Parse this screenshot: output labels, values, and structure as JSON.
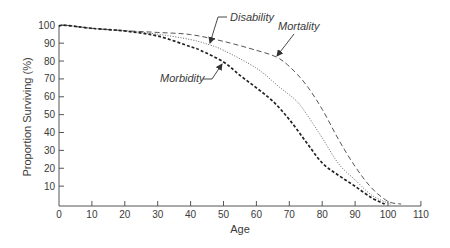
{
  "chart_data": {
    "type": "line",
    "title": "",
    "xlabel": "Age",
    "ylabel": "Proportion Surviving (%)",
    "xlim": [
      0,
      110
    ],
    "ylim": [
      0,
      100
    ],
    "x_ticks": [
      0,
      10,
      20,
      30,
      40,
      50,
      60,
      70,
      80,
      90,
      100,
      110
    ],
    "y_ticks": [
      10,
      20,
      30,
      40,
      50,
      60,
      70,
      80,
      90,
      100
    ],
    "grid": false,
    "legend": "none (inline annotations with arrows)",
    "series": [
      {
        "name": "Mortality",
        "style": "dashed",
        "color": "#555555",
        "x": [
          0,
          2,
          10,
          20,
          30,
          40,
          50,
          60,
          66,
          70,
          75,
          80,
          85,
          90,
          95,
          100,
          104
        ],
        "values": [
          99.6,
          100,
          98.3,
          97,
          96,
          94.8,
          91,
          86,
          82.3,
          77,
          67,
          53,
          36,
          21,
          9,
          1.5,
          0
        ]
      },
      {
        "name": "Disability",
        "style": "dotted",
        "color": "#555555",
        "x": [
          0,
          2,
          10,
          20,
          30,
          40,
          46,
          50,
          60,
          67,
          72,
          75,
          80,
          85,
          90,
          95,
          100,
          101
        ],
        "values": [
          99.6,
          100,
          98.3,
          96.8,
          95,
          92,
          88.9,
          86,
          76,
          65.4,
          58,
          51,
          37,
          22.5,
          13.5,
          5,
          0.5,
          0
        ]
      },
      {
        "name": "Morbidity",
        "style": "heavy-dashed",
        "color": "#222222",
        "x": [
          0,
          2,
          10,
          20,
          30,
          40,
          43,
          50,
          55,
          60,
          65,
          70,
          75,
          80,
          85,
          90,
          95,
          99
        ],
        "values": [
          99.6,
          100,
          98.3,
          96.8,
          94,
          88,
          86,
          79.5,
          72,
          65,
          57.5,
          47.3,
          35,
          23,
          16,
          9.9,
          3.5,
          0
        ]
      }
    ],
    "annotations": [
      {
        "text": "Disability",
        "target_series": "Disability",
        "text_pos": [
          230,
          21
        ],
        "leader": [
          [
            227,
            17
          ],
          [
            218,
            17
          ],
          [
            210,
            43
          ]
        ]
      },
      {
        "text": "Mortality",
        "target_series": "Mortality",
        "text_pos": [
          278,
          30
        ],
        "leader": [
          [
            294,
            34
          ],
          [
            277,
            56
          ]
        ]
      },
      {
        "text": "Morbidity",
        "target_series": "Morbidity",
        "text_pos": [
          160,
          82
        ],
        "leader": [
          [
            203,
            79
          ],
          [
            212,
            79
          ],
          [
            222,
            64
          ]
        ]
      }
    ]
  },
  "labels": {
    "xlabel": "Age",
    "ylabel": "Proportion Surviving (%)"
  }
}
